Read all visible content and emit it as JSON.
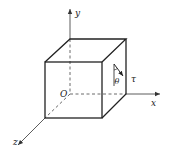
{
  "figure": {
    "type": "3D stress element cube with coordinate axes",
    "axes": {
      "x_label": "x",
      "y_label": "y",
      "z_label": "z",
      "origin_label": "O"
    },
    "annotations": {
      "angle_label": "θ",
      "shear_label": "τ"
    },
    "colors": {
      "line": "#222222",
      "background": "#ffffff"
    }
  }
}
